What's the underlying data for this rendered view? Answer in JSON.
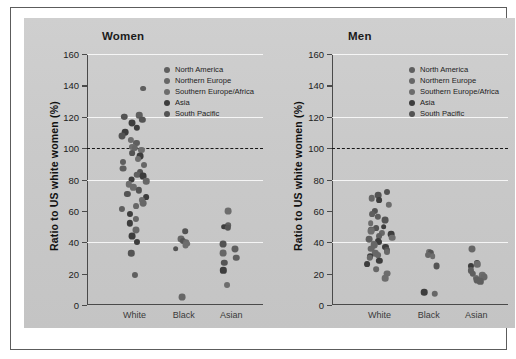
{
  "figure": {
    "background_color": "#c9c9c9",
    "frame_color": "#5c5c5c"
  },
  "chart_data": {
    "type": "scatter",
    "title": "",
    "xlabel": "",
    "ylabel": "Ratio to US  white women (%)",
    "ylim": [
      0,
      160
    ],
    "yticks": [
      0,
      20,
      40,
      60,
      80,
      100,
      120,
      140,
      160
    ],
    "categories": [
      "White",
      "Black",
      "Asian"
    ],
    "grid": "horizontal-white-gridlines",
    "reference_line": {
      "value": 100,
      "style": "dashed",
      "color": "#161616"
    },
    "legend_position": "upper-right-inside",
    "legend": [
      {
        "label": "North America",
        "color": "#5f5f5f"
      },
      {
        "label": "Northern Europe",
        "color": "#676767"
      },
      {
        "label": "Southern Europe/Africa",
        "color": "#6d6d6d"
      },
      {
        "label": "Asia",
        "color": "#3d3d3d"
      },
      {
        "label": "South Pacific",
        "color": "#545454"
      }
    ],
    "panels": [
      {
        "title": "Women",
        "groups": [
          {
            "category": "White",
            "values": [
              138,
              121,
              120,
              120,
              118,
              116,
              113,
              110,
              108,
              105,
              103,
              101,
              100,
              99,
              97,
              95,
              93,
              91,
              89,
              87,
              85,
              83,
              82,
              80,
              79,
              77,
              75,
              73,
              71,
              69,
              67,
              65,
              63,
              61,
              58,
              55,
              52,
              48,
              44,
              40,
              33,
              19
            ],
            "n": 42
          },
          {
            "category": "Black",
            "values": [
              47,
              42,
              41,
              40,
              39,
              38,
              36,
              5
            ],
            "n": 8
          },
          {
            "category": "Asian",
            "values": [
              60,
              51,
              50,
              49,
              39,
              36,
              33,
              30,
              27,
              22,
              13
            ],
            "n": 11
          }
        ]
      },
      {
        "title": "Men",
        "groups": [
          {
            "category": "White",
            "values": [
              72,
              70,
              68,
              67,
              64,
              60,
              58,
              56,
              54,
              52,
              50,
              49,
              48,
              47,
              46,
              45,
              44,
              43,
              42,
              41,
              40,
              39,
              38,
              37,
              36,
              35,
              34,
              33,
              32,
              31,
              30,
              28,
              26,
              23,
              20,
              17
            ],
            "n": 36
          },
          {
            "category": "Black",
            "values": [
              34,
              33,
              32,
              31,
              25,
              8,
              7
            ],
            "n": 7
          },
          {
            "category": "Asian",
            "values": [
              36,
              27,
              26,
              25,
              22,
              20,
              19,
              18,
              17,
              16,
              15
            ],
            "n": 11
          }
        ]
      }
    ]
  },
  "panel_women": {
    "title": "Women",
    "ylabel": "Ratio to US  white women (%)",
    "xticks": [
      "White",
      "Black",
      "Asian"
    ],
    "yticks": [
      "160",
      "140",
      "120",
      "100",
      "80",
      "60",
      "40",
      "20",
      "0"
    ]
  },
  "panel_men": {
    "title": "Men",
    "ylabel": "Ratio to US  white women (%)",
    "xticks": [
      "White",
      "Black",
      "Asian"
    ],
    "yticks": [
      "160",
      "140",
      "120",
      "100",
      "80",
      "60",
      "40",
      "20",
      "0"
    ]
  }
}
